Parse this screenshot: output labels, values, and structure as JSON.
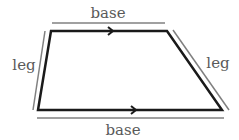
{
  "diagram": {
    "shape": "trapezoid",
    "labels": {
      "top_base": "base",
      "bottom_base": "base",
      "left_leg": "leg",
      "right_leg": "leg"
    },
    "colors": {
      "outline": "#1a1a1a",
      "guide_lines": "#808080",
      "label_text": "#5a5a5a"
    },
    "parallel_markers": "arrows on both bases indicate parallel sides"
  }
}
